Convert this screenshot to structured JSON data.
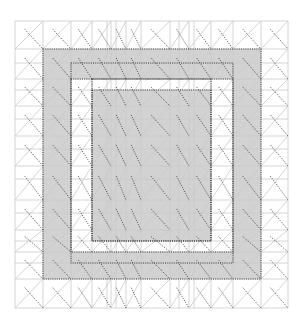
{
  "figure": {
    "width": 302,
    "height": 322,
    "background": "#ffffff",
    "type": "finite-element-mesh"
  },
  "colors": {
    "grid_line": "#c9c9c9",
    "diagonal_line": "#c9c9c9",
    "dotted_line": "#3a3a3a",
    "region_fill": "#d2d2d2",
    "gap_fill": "#ffffff"
  },
  "mesh": {
    "x_lines": [
      15,
      43,
      71,
      92,
      107,
      111,
      116,
      126,
      141,
      170,
      179,
      189,
      194,
      211,
      233,
      261,
      288
    ],
    "y_lines": [
      21,
      49,
      63,
      79,
      90,
      106,
      119,
      136,
      149,
      166,
      179,
      200,
      213,
      230,
      241,
      252,
      263,
      279,
      308
    ]
  },
  "regions": {
    "outer_ring": {
      "x0": 43,
      "y0": 49,
      "x1": 261,
      "y1": 279
    },
    "outer_ring_inner_edge": {
      "x0": 71,
      "y0": 79,
      "x1": 233,
      "y1": 252
    },
    "inner_block": {
      "x0": 92,
      "y0": 90,
      "x1": 211,
      "y1": 241
    }
  }
}
